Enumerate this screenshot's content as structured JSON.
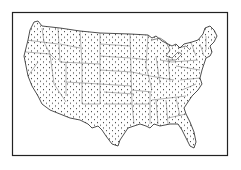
{
  "map": {
    "subject": "Contiguous United States with state boundaries",
    "style": "dot stipple fill",
    "colors": {
      "background": "#ffffff",
      "ink": "#1a1a1a",
      "frame": "#222222"
    }
  }
}
